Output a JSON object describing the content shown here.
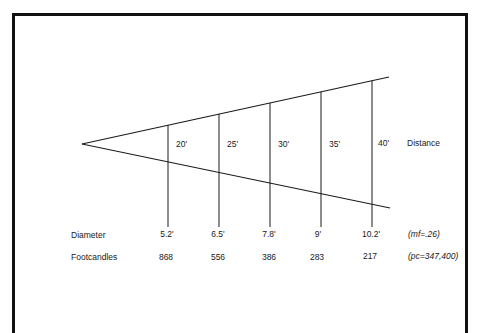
{
  "diagram": {
    "type": "light-beam-cone",
    "distance_label": "Distance",
    "distances": [
      "20'",
      "25'",
      "30'",
      "35'",
      "40'"
    ],
    "diameter_label": "Diameter",
    "diameters": [
      "5.2'",
      "6.5'",
      "7.8'",
      "9'",
      "10.2'"
    ],
    "footcandles_label": "Footcandles",
    "footcandles": [
      "868",
      "556",
      "386",
      "283",
      "217"
    ],
    "multiplying_factor": "(mf=.26)",
    "peak_candela": "(pc=347,400)"
  },
  "colors": {
    "line": "#1a1a1a",
    "frame": "#111111",
    "background": "#ffffff"
  }
}
